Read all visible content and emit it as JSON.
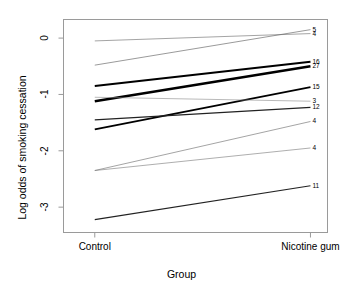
{
  "chart_data": {
    "type": "line",
    "title": "",
    "xlabel": "Group",
    "ylabel": "Log odds of smoking cessation",
    "categories": [
      "Control",
      "Nicotine gum"
    ],
    "x": [
      0,
      1
    ],
    "xlim": [
      -0.145,
      1.079
    ],
    "ylim": [
      -3.45,
      0.33
    ],
    "ytick_labels": [
      "0",
      "-1",
      "-2",
      "-3"
    ],
    "ytick_values": [
      0,
      -1,
      -2,
      -3
    ],
    "xtick_labels": [
      "Control",
      "Nicotine gum"
    ],
    "grid": false,
    "legend": "none",
    "annotation_note": "Each line is a study labelled at its right-hand endpoint by study size; line width is proportional to study weight.",
    "series": [
      {
        "name": "5",
        "label": "5",
        "values": [
          -0.48,
          0.15
        ],
        "linewidth": 0.6,
        "color": "#555555"
      },
      {
        "name": "4a",
        "label": "4",
        "values": [
          -0.05,
          0.08
        ],
        "linewidth": 0.6,
        "color": "#666666"
      },
      {
        "name": "16",
        "label": "16",
        "values": [
          -0.85,
          -0.42
        ],
        "linewidth": 1.9,
        "color": "#000000"
      },
      {
        "name": "27",
        "label": "27",
        "values": [
          -1.12,
          -0.5
        ],
        "linewidth": 2.6,
        "color": "#000000"
      },
      {
        "name": "15",
        "label": "15",
        "values": [
          -1.62,
          -0.87
        ],
        "linewidth": 1.8,
        "color": "#000000"
      },
      {
        "name": "3",
        "label": "3",
        "values": [
          -1.05,
          -1.12
        ],
        "linewidth": 0.6,
        "color": "#8a8a8a"
      },
      {
        "name": "12",
        "label": "12",
        "values": [
          -1.45,
          -1.23
        ],
        "linewidth": 1.3,
        "color": "#222222"
      },
      {
        "name": "4b",
        "label": "4",
        "values": [
          -2.35,
          -1.48
        ],
        "linewidth": 0.6,
        "color": "#666666"
      },
      {
        "name": "4c",
        "label": "4",
        "values": [
          -2.35,
          -1.95
        ],
        "linewidth": 0.6,
        "color": "#777777"
      },
      {
        "name": "11",
        "label": "11",
        "values": [
          -3.22,
          -2.62
        ],
        "linewidth": 1.2,
        "color": "#222222"
      }
    ]
  },
  "axes": {
    "frame_color": "#9a9a9a",
    "tick_color": "#9a9a9a",
    "background": "#ffffff"
  }
}
